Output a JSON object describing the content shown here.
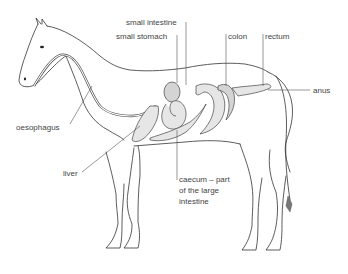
{
  "diagram": {
    "labels": {
      "small_intestine": "small intestine",
      "small_stomach": "small stomach",
      "colon": "colon",
      "rectum": "rectum",
      "anus": "anus",
      "oesophagus": "oesophagus",
      "liver": "liver",
      "caecum_line1": "caecum – part",
      "caecum_line2": "of the large",
      "caecum_line3": "intestine"
    }
  }
}
